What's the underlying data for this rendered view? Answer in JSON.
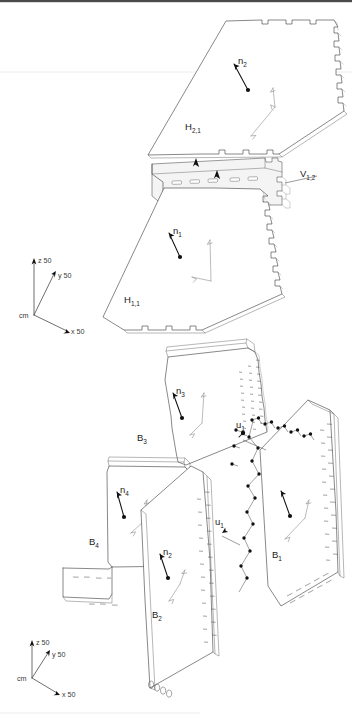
{
  "figure": {
    "units": "cm",
    "background_color": "#ffffff",
    "line_color": "#3f3f3f",
    "accent_color": "#111111"
  },
  "assembly_top": {
    "name": "horizontal-shelf-group",
    "panels": [
      {
        "id": "H2",
        "label": "H",
        "sub": "2,1",
        "role": "upper horizontal panel"
      },
      {
        "id": "V12",
        "label": "V",
        "sub": "1,2",
        "role": "vertical divider strip"
      },
      {
        "id": "H1",
        "label": "H",
        "sub": "1,1",
        "role": "lower horizontal panel"
      }
    ],
    "normals": [
      {
        "id": "n2",
        "label": "n",
        "sub": "2",
        "on": "H2"
      },
      {
        "id": "n1",
        "label": "n",
        "sub": "1",
        "on": "H1"
      }
    ]
  },
  "assembly_bottom": {
    "name": "box-carcass-group",
    "panels": [
      {
        "id": "B3",
        "label": "B",
        "sub": "3",
        "role": "top panel"
      },
      {
        "id": "B4",
        "label": "B",
        "sub": "4",
        "role": "left side panel"
      },
      {
        "id": "B2",
        "label": "B",
        "sub": "2",
        "role": "front panel"
      },
      {
        "id": "B1",
        "label": "B",
        "sub": "1",
        "role": "detached right panel"
      }
    ],
    "normals": [
      {
        "id": "n3",
        "label": "n",
        "sub": "3",
        "on": "B3"
      },
      {
        "id": "n4",
        "label": "n",
        "sub": "4",
        "on": "B4"
      },
      {
        "id": "n2b",
        "label": "n",
        "sub": "2",
        "on": "B2"
      }
    ],
    "connectors": [
      {
        "id": "u1a",
        "label": "u",
        "sub": "1",
        "role": "joint connector callout upper"
      },
      {
        "id": "u1b",
        "label": "u",
        "sub": "1",
        "role": "joint connector callout lower"
      }
    ]
  },
  "axes_top": {
    "name": "coordinate-triad-top",
    "origin_label": "cm",
    "x": "x 50",
    "y": "y 50",
    "z": "z 50"
  },
  "axes_bottom": {
    "name": "coordinate-triad-bottom",
    "origin_label": "cm",
    "x": "x 50",
    "y": "y 50",
    "z": "z 50"
  }
}
